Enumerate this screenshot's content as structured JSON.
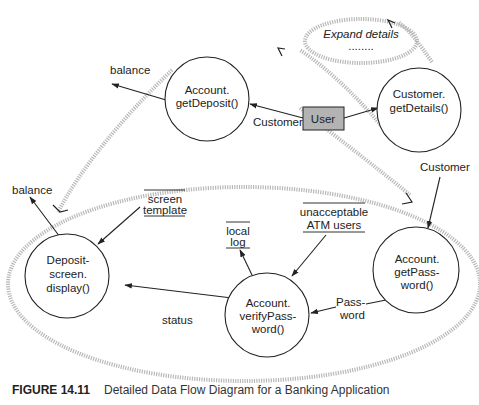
{
  "diagram": {
    "type": "data-flow-diagram",
    "nodes": {
      "get_deposit": {
        "line1": "Account.",
        "line2": "getDeposit()"
      },
      "get_details": {
        "line1": "Customer.",
        "line2": "getDetails()"
      },
      "user": {
        "label": "User"
      },
      "expand": {
        "line1": "Expand details",
        "line2": "........"
      },
      "deposit_display": {
        "line1": "Deposit-",
        "line2": "screen.",
        "line3": "display()"
      },
      "verify_password": {
        "line1": "Account.",
        "line2": "verifyPass-",
        "line3": "word()"
      },
      "get_password": {
        "line1": "Account.",
        "line2": "getPass-",
        "line3": "word()"
      }
    },
    "stores": {
      "screen_template": {
        "line1": "screen",
        "line2": "template"
      },
      "local_log": {
        "line1": "local",
        "line2": "log"
      },
      "unacceptable": {
        "line1": "unacceptable",
        "line2": "ATM users"
      }
    },
    "flows": {
      "balance_top": "balance",
      "balance_left": "balance",
      "customer_user": "Customer",
      "customer_right": "Customer",
      "status": "status",
      "password_line1": "Pass-",
      "password_line2": "word"
    },
    "colors": {
      "user_box_fill": "#b3b3b3",
      "dotted_stroke": "#b8b8b8",
      "line": "#222222"
    }
  },
  "caption": {
    "figure": "FIGURE 14.11",
    "text": "Detailed Data Flow Diagram for a Banking Application"
  }
}
